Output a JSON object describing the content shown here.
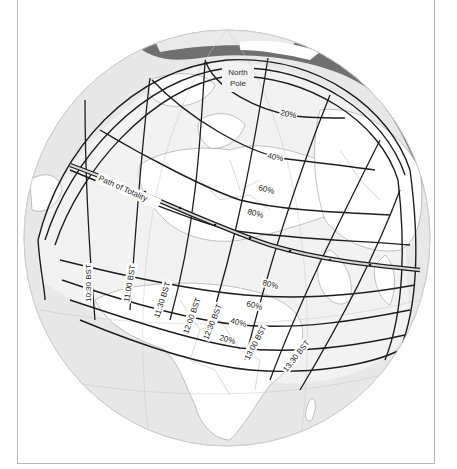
{
  "map": {
    "type": "orthographic-globe",
    "subject": "Solar eclipse path",
    "colors": {
      "ocean": "#e6e6e6",
      "land": "#ffffff",
      "polar_ice": "#6e6e6e",
      "penumbra_shade": "#ebebeb",
      "lines": "#1e1e1e",
      "frame": "#b8b8b8"
    },
    "labels": {
      "north_pole": [
        "North",
        "Pole"
      ],
      "path_of_totality": "Path of Totality"
    },
    "magnitude_labels_north": [
      "20%",
      "40%",
      "60%",
      "80%"
    ],
    "magnitude_labels_south": [
      "80%",
      "60%",
      "40%",
      "20%"
    ],
    "time_labels": [
      "10:30 BST",
      "11:00 BST",
      "11:30 BST",
      "12:00 BST",
      "12:30 BST",
      "13:00 BST",
      "13:30 BST"
    ]
  }
}
